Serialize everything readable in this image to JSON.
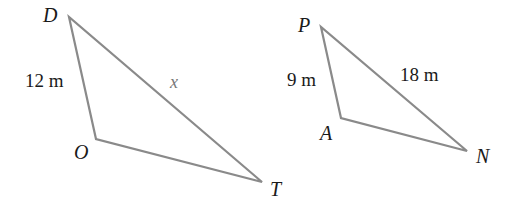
{
  "colors": {
    "edge": "#8a8a8a",
    "label": "#1a1a1a",
    "variable_label": "#777777",
    "background": "#ffffff"
  },
  "triangles": [
    {
      "name": "DOT",
      "vertices": {
        "D": {
          "label": "D",
          "x": 69,
          "y": 17,
          "label_x": 43,
          "label_y": 22
        },
        "O": {
          "label": "O",
          "x": 96,
          "y": 139,
          "label_x": 74,
          "label_y": 159
        },
        "T": {
          "label": "T",
          "x": 262,
          "y": 182,
          "label_x": 270,
          "label_y": 196
        }
      },
      "sides": [
        {
          "between": "DO",
          "label": "12 m",
          "x": 25,
          "y": 87,
          "kind": "measure"
        },
        {
          "between": "DT",
          "label": "x",
          "x": 170,
          "y": 88,
          "kind": "variable"
        },
        {
          "between": "OT",
          "label": "",
          "kind": "none"
        }
      ]
    },
    {
      "name": "PAN",
      "vertices": {
        "P": {
          "label": "P",
          "x": 321,
          "y": 27,
          "label_x": 298,
          "label_y": 32
        },
        "A": {
          "label": "A",
          "x": 341,
          "y": 118,
          "label_x": 320,
          "label_y": 140
        },
        "N": {
          "label": "N",
          "x": 467,
          "y": 151,
          "label_x": 476,
          "label_y": 163
        }
      },
      "sides": [
        {
          "between": "PA",
          "label": "9 m",
          "x": 287,
          "y": 86,
          "kind": "measure"
        },
        {
          "between": "PN",
          "label": "18 m",
          "x": 400,
          "y": 81,
          "kind": "measure"
        },
        {
          "between": "AN",
          "label": "",
          "kind": "none"
        }
      ]
    }
  ],
  "labels": {
    "D": "D",
    "O": "O",
    "T": "T",
    "P": "P",
    "A": "A",
    "N": "N",
    "DO": "12 m",
    "DT": "x",
    "PA": "9 m",
    "PN": "18 m"
  }
}
